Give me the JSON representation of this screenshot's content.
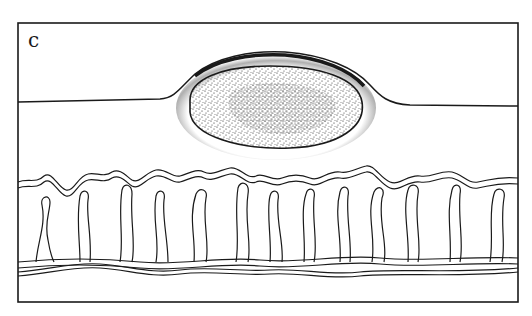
{
  "figure": {
    "panel_label": "c",
    "colors": {
      "ink": "#1a1a1a",
      "background": "#ffffff"
    },
    "frame": {
      "x": 18,
      "y": 23,
      "width": 500,
      "height": 279
    },
    "loop_count": 18
  }
}
